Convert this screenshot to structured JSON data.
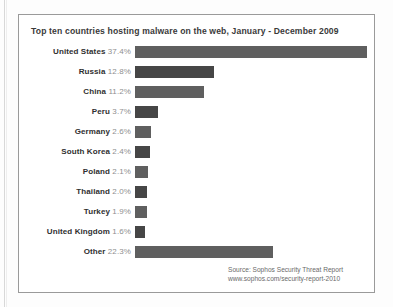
{
  "chart_data": {
    "type": "bar",
    "orientation": "horizontal",
    "title": "Top ten countries hosting malware on the web, January - December 2009",
    "xlabel": "",
    "ylabel": "",
    "grid": false,
    "legend": null,
    "xlim": [
      0,
      37.4
    ],
    "unit": "%",
    "px_per_percent": 6.2,
    "categories": [
      "United States",
      "Russia",
      "China",
      "Peru",
      "Germany",
      "South Korea",
      "Poland",
      "Thailand",
      "Turkey",
      "United Kingdom",
      "Other"
    ],
    "values": [
      37.4,
      12.8,
      11.2,
      3.7,
      2.6,
      2.4,
      2.1,
      2.0,
      1.9,
      1.6,
      22.3
    ],
    "value_labels": [
      "37.4%",
      "12.8%",
      "11.2%",
      "3.7%",
      "2.6%",
      "2.4%",
      "2.1%",
      "2.0%",
      "1.9%",
      "1.6%",
      "22.3%"
    ],
    "bar_shades": [
      "mid",
      "dark",
      "mid",
      "dark",
      "mid",
      "dark",
      "mid",
      "dark",
      "mid",
      "dark",
      "mid"
    ],
    "rows": [
      {
        "country": "United States",
        "value": 37.4,
        "label": "37.4%",
        "shade": "mid"
      },
      {
        "country": "Russia",
        "value": 12.8,
        "label": "12.8%",
        "shade": "dark"
      },
      {
        "country": "China",
        "value": 11.2,
        "label": "11.2%",
        "shade": "mid"
      },
      {
        "country": "Peru",
        "value": 3.7,
        "label": "3.7%",
        "shade": "dark"
      },
      {
        "country": "Germany",
        "value": 2.6,
        "label": "2.6%",
        "shade": "mid"
      },
      {
        "country": "South Korea",
        "value": 2.4,
        "label": "2.4%",
        "shade": "dark"
      },
      {
        "country": "Poland",
        "value": 2.1,
        "label": "2.1%",
        "shade": "mid"
      },
      {
        "country": "Thailand",
        "value": 2.0,
        "label": "2.0%",
        "shade": "dark"
      },
      {
        "country": "Turkey",
        "value": 1.9,
        "label": "1.9%",
        "shade": "mid"
      },
      {
        "country": "United Kingdom",
        "value": 1.6,
        "label": "1.6%",
        "shade": "dark"
      },
      {
        "country": "Other",
        "value": 22.3,
        "label": "22.3%",
        "shade": "mid"
      }
    ],
    "annotations": {
      "source_line1": "Source: Sophos Security Threat Report",
      "source_line2": "www.sophos.com/security-report-2010"
    }
  },
  "colors": {
    "bar_mid": "#6e6e6e",
    "bar_dark": "#464646",
    "country_text": "#2f2f2f",
    "percent_text": "#8f8f8f",
    "title_text": "#3a3a3a",
    "source_text": "#6a6a6a",
    "border": "#9a9a9a",
    "background": "#ffffff"
  }
}
